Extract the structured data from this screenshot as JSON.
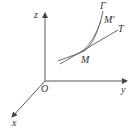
{
  "diagram": {
    "type": "3d-coordinate-curve-tangent",
    "axes": {
      "origin_label": "O",
      "x_label": "x",
      "y_label": "y",
      "z_label": "z"
    },
    "curve": {
      "label": "Γ"
    },
    "points": {
      "M": "M",
      "M_prime": "M'"
    },
    "tangent": {
      "label": "T"
    }
  },
  "colors": {
    "stroke": "#444444",
    "text": "#333333",
    "background": "#ffffff"
  }
}
